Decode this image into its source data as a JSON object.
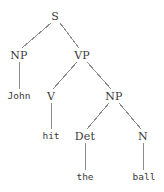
{
  "figure": {
    "kind": "syntax-parse-tree",
    "sentence": "John hit the ball",
    "width": 164,
    "height": 192,
    "background_color": "#ffffff",
    "text_color": "#3a3a3a",
    "line_color": "#8c8c8c"
  },
  "nodes": [
    {
      "id": "S",
      "label": "S",
      "type": "nonterminal",
      "x": 55,
      "y": 16
    },
    {
      "id": "NP1",
      "label": "NP",
      "type": "nonterminal",
      "x": 19,
      "y": 55
    },
    {
      "id": "VP",
      "label": "VP",
      "type": "nonterminal",
      "x": 82,
      "y": 55
    },
    {
      "id": "John",
      "label": "John",
      "type": "terminal",
      "x": 19,
      "y": 96
    },
    {
      "id": "V",
      "label": "V",
      "type": "nonterminal",
      "x": 51,
      "y": 96
    },
    {
      "id": "NP2",
      "label": "NP",
      "type": "nonterminal",
      "x": 114,
      "y": 96
    },
    {
      "id": "hit",
      "label": "hit",
      "type": "terminal",
      "x": 51,
      "y": 136
    },
    {
      "id": "Det",
      "label": "Det",
      "type": "nonterminal",
      "x": 85,
      "y": 136
    },
    {
      "id": "N",
      "label": "N",
      "type": "nonterminal",
      "x": 143,
      "y": 136
    },
    {
      "id": "the",
      "label": "the",
      "type": "terminal",
      "x": 85,
      "y": 177
    },
    {
      "id": "ball",
      "label": "ball",
      "type": "terminal",
      "x": 144,
      "y": 177
    }
  ],
  "edges": [
    {
      "from": "S",
      "to": "NP1",
      "x1": 51,
      "y1": 23,
      "x2": 22,
      "y2": 48
    },
    {
      "from": "S",
      "to": "VP",
      "x1": 60,
      "y1": 23,
      "x2": 79,
      "y2": 48
    },
    {
      "from": "NP1",
      "to": "John",
      "x1": 19,
      "y1": 62,
      "x2": 19,
      "y2": 89
    },
    {
      "from": "VP",
      "to": "V",
      "x1": 77,
      "y1": 62,
      "x2": 53,
      "y2": 89
    },
    {
      "from": "VP",
      "to": "NP2",
      "x1": 87,
      "y1": 62,
      "x2": 111,
      "y2": 89
    },
    {
      "from": "V",
      "to": "hit",
      "x1": 51,
      "y1": 103,
      "x2": 51,
      "y2": 129
    },
    {
      "from": "NP2",
      "to": "Det",
      "x1": 109,
      "y1": 103,
      "x2": 87,
      "y2": 129
    },
    {
      "from": "NP2",
      "to": "N",
      "x1": 119,
      "y1": 103,
      "x2": 141,
      "y2": 129
    },
    {
      "from": "Det",
      "to": "the",
      "x1": 85,
      "y1": 143,
      "x2": 85,
      "y2": 170
    },
    {
      "from": "N",
      "to": "ball",
      "x1": 143,
      "y1": 143,
      "x2": 143,
      "y2": 170
    }
  ]
}
